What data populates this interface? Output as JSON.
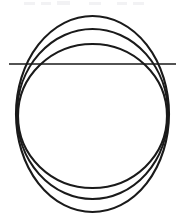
{
  "figure": {
    "background_color": "#ffffff",
    "stroke_color": "#1a1a1a",
    "width": 187,
    "height": 223
  },
  "chart_data": {
    "type": "line",
    "xlabel": "",
    "ylabel": "",
    "xlim": [
      0,
      187
    ],
    "ylim": [
      0,
      223
    ],
    "grid": false,
    "legend": "none",
    "shapes": [
      {
        "name": "outer-circle",
        "kind": "ellipse",
        "cx": 92.5,
        "cy": 114,
        "rx": 76.5,
        "ry": 98,
        "stroke": "#1a1a1a",
        "stroke_width": 2.1,
        "fill": "none"
      },
      {
        "name": "middle-circle",
        "kind": "ellipse",
        "cx": 92.5,
        "cy": 114,
        "rx": 75.5,
        "ry": 85,
        "stroke": "#1a1a1a",
        "stroke_width": 2.1,
        "fill": "none"
      },
      {
        "name": "inner-circle",
        "kind": "ellipse",
        "cx": 92.5,
        "cy": 116,
        "rx": 74.5,
        "ry": 72,
        "stroke": "#1a1a1a",
        "stroke_width": 2.1,
        "fill": "none"
      },
      {
        "name": "horizontal-chord",
        "kind": "line",
        "x1": 9,
        "y1": 64,
        "x2": 176,
        "y2": 64,
        "stroke": "#1a1a1a",
        "stroke_width": 1.7,
        "fill": "none"
      }
    ],
    "annotations": []
  },
  "artifacts": {
    "top_ghost_marks": [
      {
        "x": 24,
        "y": 2,
        "width": 11,
        "height": 3
      },
      {
        "x": 41,
        "y": 2,
        "width": 10,
        "height": 3
      },
      {
        "x": 57,
        "y": 1,
        "width": 13,
        "height": 4
      },
      {
        "x": 89,
        "y": 2,
        "width": 12,
        "height": 3
      },
      {
        "x": 117,
        "y": 2,
        "width": 10,
        "height": 3
      },
      {
        "x": 133,
        "y": 2,
        "width": 11,
        "height": 3
      }
    ]
  }
}
